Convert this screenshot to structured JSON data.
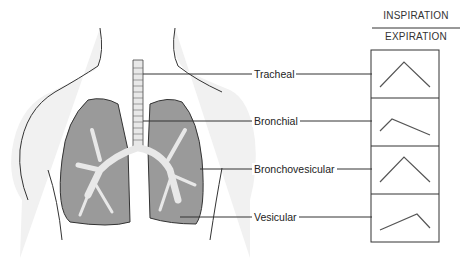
{
  "header": {
    "numerator": "INSPIRATION",
    "denominator": "EXPIRATION"
  },
  "sounds": [
    {
      "name": "Tracheal",
      "pattern": "equal inspiration and expiration, peaked"
    },
    {
      "name": "Bronchial",
      "pattern": "short inspiration, longer expiration"
    },
    {
      "name": "Bronchovesicular",
      "pattern": "equal inspiration and expiration"
    },
    {
      "name": "Vesicular",
      "pattern": "long inspiration, short expiration"
    }
  ],
  "colors": {
    "lung_fill": "#9a9a9a",
    "body_fill": "#f0f0f0",
    "airway_fill": "#e8e8e8",
    "line": "#333333"
  }
}
